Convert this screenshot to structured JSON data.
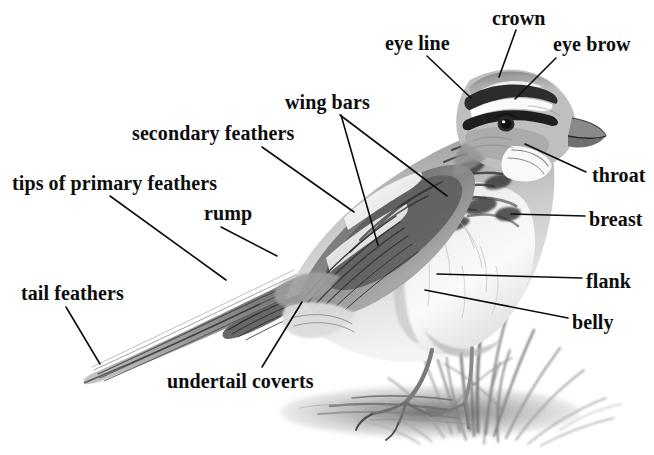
{
  "diagram": {
    "style": "graphite pencil drawing",
    "background_color": "#ffffff",
    "ink_color": "#0d0d0d",
    "width": 654,
    "height": 455
  },
  "labels": [
    {
      "id": "eye-line",
      "text": "eye line",
      "x": 385,
      "y": 33,
      "anchor": "left"
    },
    {
      "id": "crown",
      "text": "crown",
      "x": 492,
      "y": 8,
      "anchor": "left"
    },
    {
      "id": "eye-brow",
      "text": "eye brow",
      "x": 553,
      "y": 34,
      "anchor": "left"
    },
    {
      "id": "wing-bars",
      "text": "wing bars",
      "x": 285,
      "y": 92,
      "anchor": "left"
    },
    {
      "id": "secondary-feathers",
      "text": "secondary feathers",
      "x": 132,
      "y": 123,
      "anchor": "left"
    },
    {
      "id": "tips-of-primary-feathers",
      "text": "tips of primary feathers",
      "x": 12,
      "y": 173,
      "anchor": "left"
    },
    {
      "id": "rump",
      "text": "rump",
      "x": 204,
      "y": 203,
      "anchor": "left"
    },
    {
      "id": "tail-feathers",
      "text": "tail feathers",
      "x": 21,
      "y": 283,
      "anchor": "left"
    },
    {
      "id": "undertail-coverts",
      "text": "undertail coverts",
      "x": 167,
      "y": 371,
      "anchor": "left"
    },
    {
      "id": "throat",
      "text": "throat",
      "x": 592,
      "y": 165,
      "anchor": "left"
    },
    {
      "id": "breast",
      "text": "breast",
      "x": 589,
      "y": 209,
      "anchor": "left"
    },
    {
      "id": "flank",
      "text": "flank",
      "x": 586,
      "y": 271,
      "anchor": "left"
    },
    {
      "id": "belly",
      "text": "belly",
      "x": 572,
      "y": 312,
      "anchor": "left"
    }
  ],
  "leader_lines": [
    {
      "id": "leader-eye-line",
      "from": [
        427,
        56
      ],
      "to": [
        471,
        98
      ]
    },
    {
      "id": "leader-crown",
      "from": [
        516,
        30
      ],
      "to": [
        499,
        77
      ]
    },
    {
      "id": "leader-eye-brow",
      "from": [
        556,
        58
      ],
      "to": [
        515,
        99
      ]
    },
    {
      "id": "leader-wing-bars-upper",
      "from": [
        340,
        115
      ],
      "to": [
        447,
        196
      ]
    },
    {
      "id": "leader-wing-bars-lower",
      "from": [
        341,
        115
      ],
      "to": [
        378,
        245
      ]
    },
    {
      "id": "leader-secondary-feathers",
      "from": [
        262,
        147
      ],
      "to": [
        354,
        212
      ]
    },
    {
      "id": "leader-tips-of-primary-feathers",
      "from": [
        110,
        196
      ],
      "to": [
        226,
        280
      ]
    },
    {
      "id": "leader-rump",
      "from": [
        221,
        227
      ],
      "to": [
        277,
        256
      ]
    },
    {
      "id": "leader-tail-feathers",
      "from": [
        66,
        307
      ],
      "to": [
        100,
        364
      ]
    },
    {
      "id": "leader-undertail-coverts",
      "from": [
        262,
        367
      ],
      "to": [
        302,
        302
      ]
    },
    {
      "id": "leader-throat",
      "from": [
        586,
        172
      ],
      "to": [
        525,
        144
      ]
    },
    {
      "id": "leader-breast",
      "from": [
        585,
        216
      ],
      "to": [
        511,
        214
      ]
    },
    {
      "id": "leader-flank",
      "from": [
        582,
        278
      ],
      "to": [
        437,
        274
      ]
    },
    {
      "id": "leader-belly",
      "from": [
        568,
        318
      ],
      "to": [
        425,
        290
      ]
    }
  ]
}
